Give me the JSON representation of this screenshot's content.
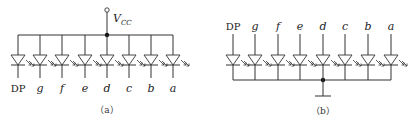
{
  "panel_a": {
    "caption": "（a）",
    "type": "common-anode",
    "supply_label": "V",
    "supply_sub": "CC",
    "segments": [
      "DP",
      "g",
      "f",
      "e",
      "d",
      "c",
      "b",
      "a"
    ]
  },
  "panel_b": {
    "caption": "（b）",
    "type": "common-cathode",
    "segments": [
      "DP",
      "g",
      "f",
      "e",
      "d",
      "c",
      "b",
      "a"
    ]
  }
}
